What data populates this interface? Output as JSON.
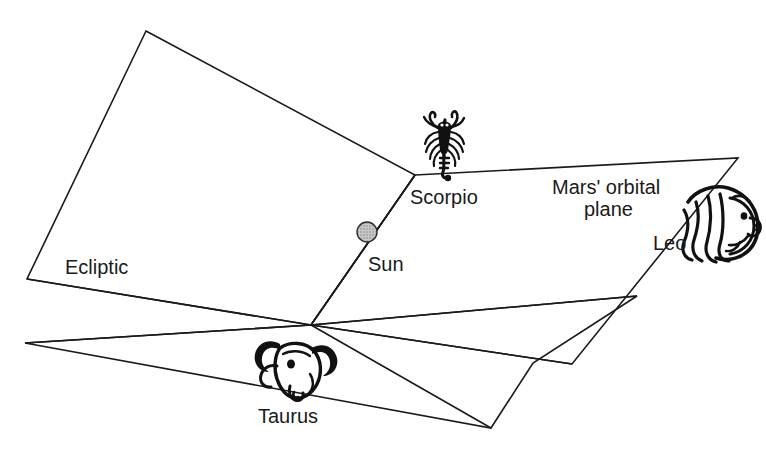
{
  "figure": {
    "kind": "astronomy-orbital-plane-diagram",
    "background_color": "#ffffff",
    "line_color": "#1a1a1a",
    "sun_fill_color": "#b3b3b3"
  },
  "labels": {
    "ecliptic": "Ecliptic",
    "mars_plane_line1": "Mars' orbital",
    "mars_plane_line2": "plane",
    "sun": "Sun",
    "scorpio": "Scorpio",
    "taurus": "Taurus",
    "leo": "Leo"
  },
  "icons": {
    "sun": "sun-marker-icon",
    "scorpio": "scorpion-icon",
    "taurus": "bull-head-icon",
    "leo": "lion-head-icon"
  },
  "geometry": {
    "node_convergence": [
      311,
      325
    ],
    "node_scorpio": [
      415,
      175
    ],
    "sun_center": [
      367,
      232
    ],
    "sun_radius": 10,
    "ecliptic_plane_points": "146,31 415,175 311,325 27,279",
    "mars_plane_points": "415,175 738,158 572,364 311,325",
    "lower_plane_points": "311,325 637,296 533,363 491,428 25,343",
    "rays": [
      {
        "name": "sun-ray",
        "from": [
          415,
          175
        ],
        "to": [
          311,
          325
        ]
      },
      {
        "name": "ecliptic-left-ray",
        "from": [
          311,
          325
        ],
        "to": [
          27,
          279
        ]
      },
      {
        "name": "lower-left-ray",
        "from": [
          311,
          325
        ],
        "to": [
          25,
          343
        ]
      },
      {
        "name": "mars-lower-ray",
        "from": [
          311,
          325
        ],
        "to": [
          637,
          296
        ]
      },
      {
        "name": "lower-bottom-ray",
        "from": [
          311,
          325
        ],
        "to": [
          491,
          428
        ]
      },
      {
        "name": "mars-bottom-ray",
        "from": [
          311,
          325
        ],
        "to": [
          572,
          364
        ]
      }
    ]
  }
}
